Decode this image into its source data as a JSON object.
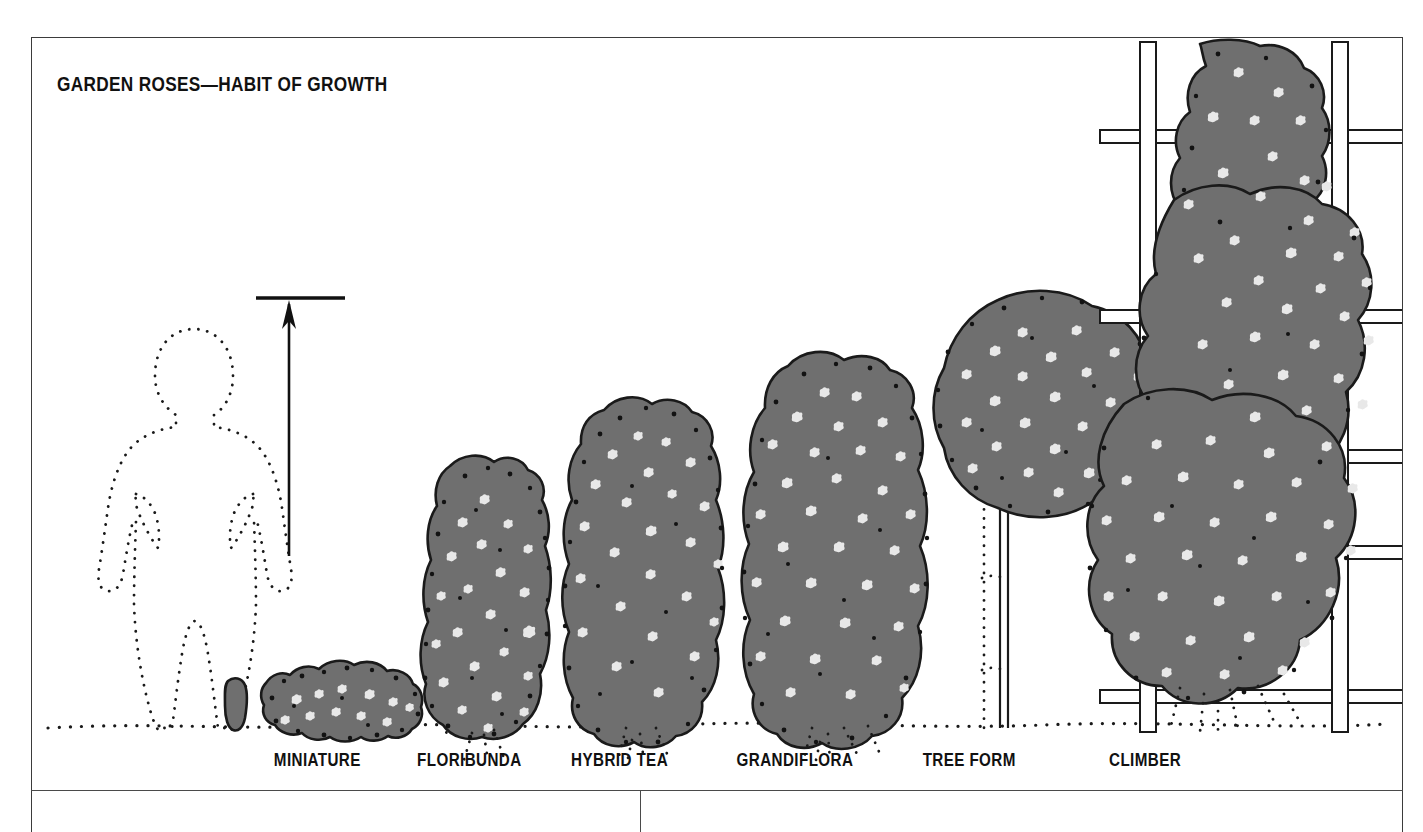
{
  "figure": {
    "title": "GARDEN ROSES—HABIT OF GROWTH",
    "colors": {
      "foliage": "#6f6f6f",
      "foliage_outline": "#1a1a1a",
      "bloom": "#e8e8e8",
      "speckle": "#121212",
      "ink": "#111111",
      "frame": "#3b3b3b",
      "ground": "#1a1a1a",
      "trellis_stroke": "#1a1a1a",
      "trellis_fill": "#ffffff"
    },
    "scale_figure": {
      "name": "human-silhouette",
      "style": "dotted-outline",
      "description": "Standing adult figure, hands on hips, drawn as a dotted outline for scale"
    },
    "height_arrow": {
      "name": "height-reference-arrow",
      "description": "Vertical arrow with horizontal cap bar indicating reference height",
      "cap_y": 297,
      "tip_y": 303,
      "base_y": 556,
      "x": 289
    },
    "ground_line": {
      "name": "ground-line",
      "style": "dotted",
      "y": 724
    },
    "categories": [
      {
        "id": "miniature",
        "label": "MINIATURE",
        "label_x": 231,
        "center_x": 310,
        "top_y": 632,
        "base_y": 738,
        "width": 140,
        "shape": "low-mound",
        "bloom_count": 11
      },
      {
        "id": "floribunda",
        "label": "FLORIBUNDA",
        "label_x": 372,
        "center_x": 452,
        "top_y": 462,
        "base_y": 740,
        "width": 152,
        "shape": "rounded-teardrop",
        "bloom_count": 22
      },
      {
        "id": "hybrid-tea",
        "label": "HYBRID TEA",
        "label_x": 527,
        "center_x": 602,
        "top_y": 398,
        "base_y": 718,
        "width": 172,
        "shape": "upright-oval",
        "bloom_count": 24
      },
      {
        "id": "grandiflora",
        "label": "GRANDIFLORA",
        "label_x": 690,
        "center_x": 800,
        "top_y": 352,
        "base_y": 722,
        "width": 196,
        "shape": "tall-broad-oval",
        "bloom_count": 26
      },
      {
        "id": "tree-form",
        "label": "TREE FORM",
        "label_x": 879,
        "center_x": 1002,
        "top_y": 296,
        "base_y": 724,
        "width": 216,
        "shape": "standard-round-head-on-trunk",
        "bloom_count": 24,
        "trunk": {
          "name": "tree-form-trunk",
          "top_y": 478,
          "bottom_y": 724,
          "stake": "dotted support stake with two ties"
        }
      },
      {
        "id": "climber",
        "label": "CLIMBER",
        "label_x": 1068,
        "center_x": 1255,
        "top_y": 38,
        "base_y": 726,
        "width": 250,
        "shape": "trained-on-trellis",
        "bloom_count": 58,
        "trellis": {
          "name": "trellis",
          "posts_x": [
            1146,
            1337
          ],
          "rail_y": [
            120,
            310,
            450,
            545,
            690
          ]
        }
      }
    ]
  },
  "layout": {
    "divider_rule": "horizontal rule beneath category labels",
    "column_divider": "vertical rule starting below horizontal rule"
  }
}
